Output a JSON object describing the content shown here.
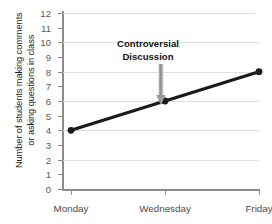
{
  "chart_data": {
    "type": "line",
    "title": "",
    "xlabel": "",
    "ylabel_lines": [
      "Number of students making comments",
      "or asking questions in class"
    ],
    "categories": [
      "Monday",
      "Wednesday",
      "Friday"
    ],
    "values": [
      4,
      6,
      8
    ],
    "ylim": [
      0,
      12
    ],
    "yticks": [
      0,
      1,
      2,
      3,
      4,
      5,
      6,
      7,
      8,
      9,
      10,
      11,
      12
    ],
    "ytick_labels": [
      "0",
      "1",
      "2",
      "3",
      "4",
      "5",
      "6",
      "7",
      "8",
      "9",
      "10",
      "11",
      "12"
    ],
    "gridline_values": [
      2,
      4,
      6,
      8,
      10,
      12
    ],
    "grid": true,
    "legend": "none",
    "annotations": [
      {
        "text_lines": [
          "Controversial",
          "Discussion"
        ],
        "points_to_category": "Wednesday",
        "points_to_value": 6,
        "arrow_color": "#9a9a9a"
      }
    ],
    "series_color": "#1a1a1a",
    "marker": "circle",
    "grid_color": "#dedede",
    "axis_color": "#8a8a8a"
  },
  "axis": {
    "ytick_labels": [
      "12",
      "11",
      "10",
      "9",
      "8",
      "7",
      "6",
      "5",
      "4",
      "3",
      "2",
      "1",
      "0"
    ],
    "xtick_labels": [
      "Monday",
      "Wednesday",
      "Friday"
    ]
  },
  "ylabel": {
    "line1": "Number of students making comments",
    "line2": "or asking questions in class"
  },
  "annotation": {
    "line1": "Controversial",
    "line2": "Discussion"
  }
}
